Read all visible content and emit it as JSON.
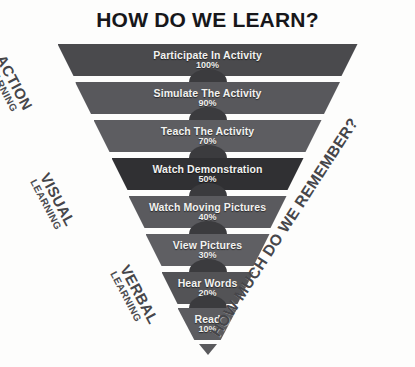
{
  "title": "HOW DO WE LEARN?",
  "side_labels": {
    "left": [
      {
        "main": "ACTION",
        "sub": "LEARNING"
      },
      {
        "main": "VISUAL",
        "sub": "LEARNING"
      },
      {
        "main": "VERBAL",
        "sub": "LEARNING"
      }
    ],
    "right": "HOW MUCH DO WE REMEMBER?"
  },
  "chart_data": {
    "type": "bar",
    "title": "HOW DO WE LEARN?",
    "xlabel": "",
    "ylabel": "HOW MUCH DO WE REMEMBER?",
    "categories": [
      "Participate In Activity",
      "Simulate The Activity",
      "Teach The Activity",
      "Watch Demonstration",
      "Watch Moving Pictures",
      "View Pictures",
      "Hear Words",
      "Read"
    ],
    "values": [
      100,
      90,
      70,
      50,
      40,
      30,
      20,
      10
    ],
    "value_labels": [
      "100%",
      "90%",
      "70%",
      "50%",
      "40%",
      "30%",
      "20%",
      "10%"
    ],
    "groups": [
      {
        "name": "ACTION LEARNING",
        "categories": [
          "Participate In Activity",
          "Simulate The Activity",
          "Teach The Activity"
        ]
      },
      {
        "name": "VISUAL LEARNING",
        "categories": [
          "Watch Demonstration",
          "Watch Moving Pictures",
          "View Pictures"
        ]
      },
      {
        "name": "VERBAL LEARNING",
        "categories": [
          "Hear Words",
          "Read"
        ]
      }
    ],
    "ylim": [
      0,
      100
    ],
    "grid": false,
    "legend": "none",
    "orientation": "inverted-pyramid"
  },
  "bars": [
    {
      "label": "Participate In Activity",
      "pct": "100%",
      "value": 100,
      "width": 300,
      "color": "#4a4a4d",
      "top": 2
    },
    {
      "label": "Simulate The Activity",
      "pct": "90%",
      "value": 90,
      "width": 265,
      "color": "#58585c",
      "top": 40
    },
    {
      "label": "Teach The Activity",
      "pct": "70%",
      "value": 70,
      "width": 228,
      "color": "#5d5d61",
      "top": 78
    },
    {
      "label": "Watch Demonstration",
      "pct": "50%",
      "value": 50,
      "width": 192,
      "color": "#303033",
      "top": 116
    },
    {
      "label": "Watch Moving Pictures",
      "pct": "40%",
      "value": 40,
      "width": 158,
      "color": "#5a5a5e",
      "top": 154
    },
    {
      "label": "View Pictures",
      "pct": "30%",
      "value": 30,
      "width": 124,
      "color": "#5f5f63",
      "top": 192
    },
    {
      "label": "Hear Words",
      "pct": "20%",
      "value": 20,
      "width": 92,
      "color": "#535356",
      "top": 230
    },
    {
      "label": "Read",
      "pct": "10%",
      "value": 10,
      "width": 60,
      "color": "#5c5c60",
      "top": 266
    }
  ],
  "colors": {
    "background": "#fdfdfc",
    "bar_default": "#555558",
    "bar_highlight": "#303033",
    "text_on_bar": "#f2f2f0",
    "title": "#17171a",
    "side_label": "#46464a"
  }
}
